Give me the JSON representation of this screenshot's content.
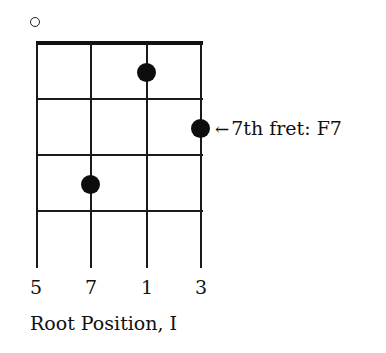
{
  "diagram": {
    "type": "chord-diagram",
    "open_string_marker": {
      "string": 1,
      "symbol": "○"
    },
    "strings": 4,
    "frets_shown": 4,
    "dots": [
      {
        "string": 3,
        "fret": 1
      },
      {
        "string": 4,
        "fret": 2
      },
      {
        "string": 2,
        "fret": 3
      }
    ],
    "annotation": {
      "arrow": "←",
      "text": "7th fret: F7"
    },
    "string_labels": [
      "5",
      "7",
      "1",
      "3"
    ],
    "caption": "Root Position, I"
  }
}
